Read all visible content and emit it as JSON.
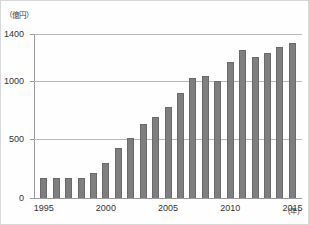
{
  "chart_data": {
    "type": "bar",
    "title": "",
    "subtitle": "",
    "xlabel": "(年)",
    "ylabel": "（億円）",
    "ylim": [
      0,
      1400
    ],
    "yticks": [
      0,
      500,
      1000,
      1400
    ],
    "ytick_labels": [
      "0",
      "500",
      "1000",
      "1400"
    ],
    "xticks": [
      1995,
      2000,
      2005,
      2010,
      2015
    ],
    "xtick_labels": [
      "1995",
      "2000",
      "2005",
      "2010",
      "2015"
    ],
    "grid": "horizontal",
    "legend": "none",
    "bar_color": "#7f7f7f",
    "bar_edge_color": "#6a6a6a",
    "gridline_color": "#b9b9b9",
    "axis_color": "#9a9a9a",
    "categories": [
      "1995",
      "1996",
      "1997",
      "1998",
      "1999",
      "2000",
      "2001",
      "2002",
      "2003",
      "2004",
      "2005",
      "2006",
      "2007",
      "2008",
      "2009",
      "2010",
      "2011",
      "2012",
      "2013",
      "2014",
      "2015"
    ],
    "values": [
      170,
      170,
      170,
      170,
      210,
      300,
      430,
      510,
      630,
      690,
      780,
      900,
      1025,
      1045,
      1000,
      1160,
      1265,
      1205,
      1235,
      1290,
      1320
    ]
  },
  "axes": {
    "y_unit_caption": "（億円）",
    "x_unit_caption": "(年)"
  }
}
